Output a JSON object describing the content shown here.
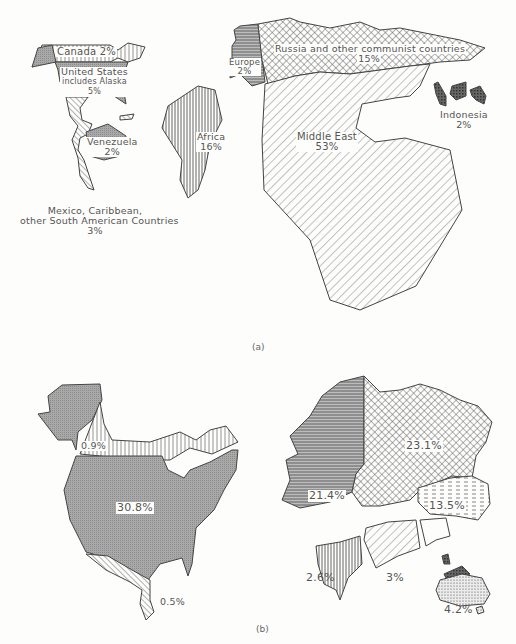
{
  "figure": {
    "panel_a": {
      "caption": "(a)",
      "regions": [
        {
          "name": "Canada",
          "label": "Canada 2%",
          "value": 2
        },
        {
          "name": "United States",
          "label_line1": "United States",
          "label_line2": "includes Alaska",
          "label_line3": "5%",
          "value": 5
        },
        {
          "name": "Venezuela",
          "label_line1": "Venezuela",
          "label_line2": "2%",
          "value": 2
        },
        {
          "name": "Mexico, Caribbean, other South American Countries",
          "label_line1": "Mexico, Caribbean,",
          "label_line2": "other South American Countries",
          "label_line3": "3%",
          "value": 3
        },
        {
          "name": "Europe",
          "label_line1": "Europe",
          "label_line2": "2%",
          "value": 2
        },
        {
          "name": "Russia and other communist countries",
          "label_line1": "Russia and other communist countries",
          "label_line2": "15%",
          "value": 15
        },
        {
          "name": "Africa",
          "label_line1": "Africa",
          "label_line2": "16%",
          "value": 16
        },
        {
          "name": "Middle East",
          "label_line1": "Middle East",
          "label_line2": "53%",
          "value": 53
        },
        {
          "name": "Indonesia",
          "label_line1": "Indonesia",
          "label_line2": "2%",
          "value": 2
        }
      ]
    },
    "panel_b": {
      "caption": "(b)",
      "regions": [
        {
          "name": "Canada",
          "label": "0.9%",
          "value": 0.9
        },
        {
          "name": "United States",
          "label": "30.8%",
          "value": 30.8
        },
        {
          "name": "Mexico & Central America",
          "label": "0.5%",
          "value": 0.5
        },
        {
          "name": "Europe",
          "label": "21.4%",
          "value": 21.4
        },
        {
          "name": "Russia & communist countries",
          "label": "23.1%",
          "value": 23.1
        },
        {
          "name": "East Asia",
          "label": "13.5%",
          "value": 13.5
        },
        {
          "name": "Africa",
          "label": "2.6%",
          "value": 2.6
        },
        {
          "name": "Middle East",
          "label": "3%",
          "value": 3
        },
        {
          "name": "Australia",
          "label": "4.2%",
          "value": 4.2
        }
      ]
    }
  }
}
